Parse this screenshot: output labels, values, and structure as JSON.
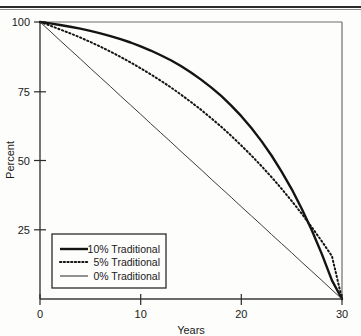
{
  "page": {
    "top_rule_present": true,
    "background_color": "#fdfdfb",
    "ink_color": "#1a1a1a"
  },
  "chart_data": {
    "type": "line",
    "title": "",
    "subtitle": "",
    "xlabel": "Years",
    "ylabel": "Percent",
    "xlim": [
      0,
      30
    ],
    "ylim": [
      0,
      100
    ],
    "xticks": [
      0,
      10,
      20,
      30
    ],
    "xtick_labels": [
      "0",
      "10",
      "20",
      "30"
    ],
    "yticks": [
      25,
      50,
      75,
      100
    ],
    "ytick_labels": [
      "25",
      "50",
      "75",
      "100"
    ],
    "grid": false,
    "legend_position": "lower-left",
    "x": [
      0,
      1,
      2,
      3,
      4,
      5,
      6,
      7,
      8,
      9,
      10,
      11,
      12,
      13,
      14,
      15,
      16,
      17,
      18,
      19,
      20,
      21,
      22,
      23,
      24,
      25,
      26,
      27,
      28,
      29,
      30
    ],
    "series": [
      {
        "name": "10%  Traditional",
        "rate_label": "10%",
        "style": "solid-thick",
        "color": "#141414",
        "values": [
          100.0,
          99.5,
          98.9,
          98.3,
          97.6,
          96.8,
          95.9,
          94.9,
          93.8,
          92.6,
          91.2,
          89.7,
          88.0,
          86.2,
          84.1,
          81.8,
          79.2,
          76.4,
          73.3,
          69.8,
          66.0,
          61.7,
          57.0,
          51.8,
          46.0,
          39.7,
          32.6,
          24.8,
          16.2,
          6.7,
          0.0
        ]
      },
      {
        "name": "5%  Traditional",
        "rate_label": "5%",
        "style": "dotted",
        "color": "#141414",
        "values": [
          100.0,
          98.7,
          97.3,
          95.9,
          94.4,
          92.8,
          91.1,
          89.3,
          87.4,
          85.4,
          83.3,
          81.1,
          78.8,
          76.4,
          73.8,
          71.1,
          68.3,
          65.3,
          62.2,
          58.9,
          55.4,
          51.8,
          48.0,
          44.0,
          39.8,
          35.4,
          30.8,
          25.9,
          20.8,
          15.5,
          0.0
        ]
      },
      {
        "name": "0%  Traditional",
        "rate_label": "0%",
        "style": "solid-thin",
        "color": "#3a3a3a",
        "values": [
          100.0,
          96.7,
          93.3,
          90.0,
          86.7,
          83.3,
          80.0,
          76.7,
          73.3,
          70.0,
          66.7,
          63.3,
          60.0,
          56.7,
          53.3,
          50.0,
          46.7,
          43.3,
          40.0,
          36.7,
          33.3,
          30.0,
          26.7,
          23.3,
          20.0,
          16.7,
          13.3,
          10.0,
          6.7,
          3.3,
          0.0
        ]
      }
    ],
    "legend_entries": [
      {
        "label": "10%  Traditional",
        "rate": "10%",
        "name": "Traditional",
        "style": "solid-thick"
      },
      {
        "label": "5%  Traditional",
        "rate": "5%",
        "name": "Traditional",
        "style": "dotted"
      },
      {
        "label": "0%  Traditional",
        "rate": "0%",
        "name": "Traditional",
        "style": "solid-thin"
      }
    ]
  }
}
